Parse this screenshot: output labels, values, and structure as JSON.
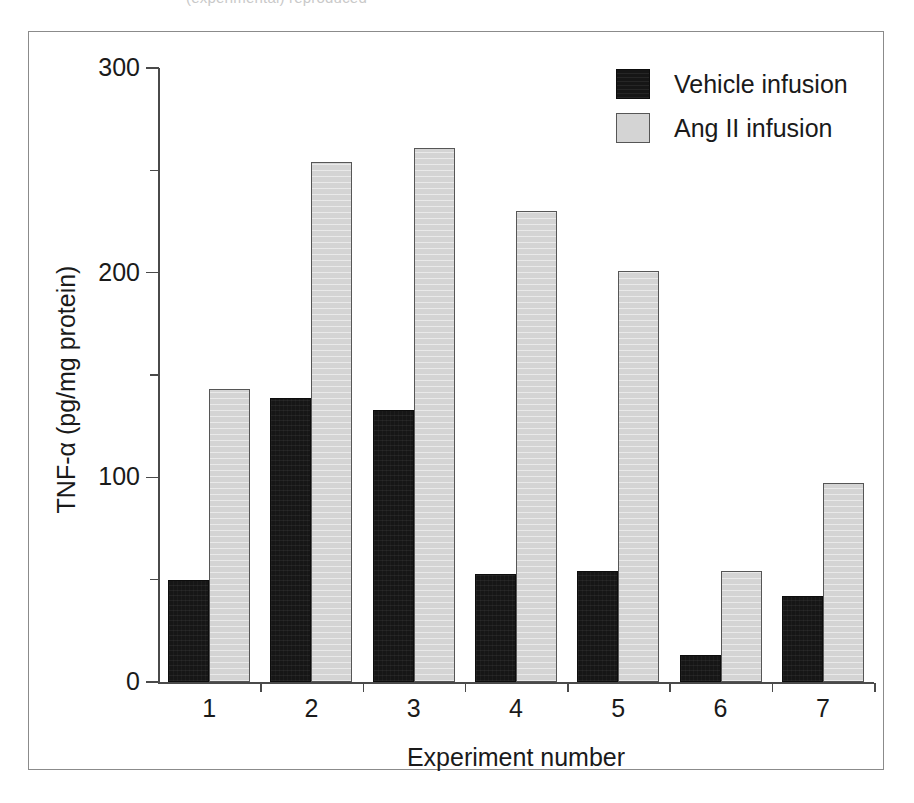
{
  "figure": {
    "top_caption_remnant": "(experimental) reproduced",
    "frame_visible": true
  },
  "legend": {
    "position": "top-right",
    "entries": [
      {
        "label": "Vehicle infusion",
        "swatch": "vehicle-swatch",
        "color": "#161616"
      },
      {
        "label": "Ang II infusion",
        "swatch": "angii-swatch",
        "color": "#d4d4d4"
      }
    ]
  },
  "chart_data": {
    "type": "bar",
    "title": "",
    "xlabel": "Experiment number",
    "ylabel": "TNF-α (pg/mg protein)",
    "categories": [
      "1",
      "2",
      "3",
      "4",
      "5",
      "6",
      "7"
    ],
    "series": [
      {
        "name": "Vehicle infusion",
        "color": "#161616",
        "values": [
          50,
          139,
          133,
          53,
          54,
          13,
          42
        ]
      },
      {
        "name": "Ang II infusion",
        "color": "#d4d4d4",
        "values": [
          143,
          254,
          261,
          230,
          201,
          54,
          97
        ]
      }
    ],
    "ylim": [
      0,
      300
    ],
    "yticks": [
      0,
      100,
      200,
      300
    ],
    "ytick_labels": [
      "0",
      "100",
      "200",
      "300"
    ],
    "yminor_ticks": [
      50,
      150,
      250
    ],
    "grid": false,
    "legend_position": "top-right"
  }
}
